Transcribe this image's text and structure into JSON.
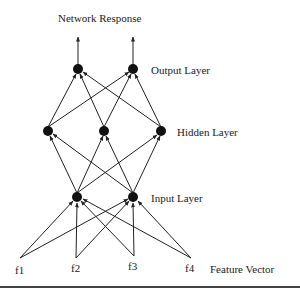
{
  "title": "Network Response",
  "layers": {
    "output": {
      "label": "Output Layer",
      "nodes": 2
    },
    "hidden": {
      "label": "Hidden Layer",
      "nodes": 3
    },
    "input": {
      "label": "Input Layer",
      "nodes": 2
    }
  },
  "features": {
    "label": "Feature Vector",
    "items": [
      "f1",
      "f2",
      "f3",
      "f4"
    ]
  },
  "colors": {
    "node": "#111111",
    "edge": "#222222",
    "text": "#222222"
  }
}
